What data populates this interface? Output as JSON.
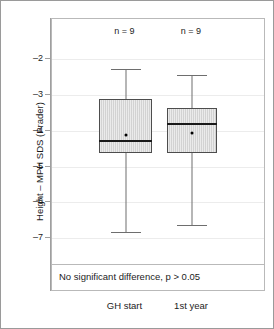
{
  "chart_data": {
    "type": "box",
    "title": "",
    "xlabel": "",
    "ylabel": "Height – MPH SDS (Prader)",
    "ylim": [
      -7.55,
      -1.55
    ],
    "yticks": [
      -2,
      -3,
      -4,
      -5,
      -6,
      -7
    ],
    "ytick_labels": [
      "–2",
      "–3",
      "–4",
      "–5",
      "–6",
      "–7"
    ],
    "grid": true,
    "legend": "none",
    "categories": [
      "GH start",
      "1st year"
    ],
    "series": [
      {
        "name": "GH start",
        "n_label": "n = 9",
        "n": 9,
        "whisker_low": -6.82,
        "q1": -4.62,
        "median": -4.28,
        "mean": -4.12,
        "q3": -3.1,
        "whisker_high": -2.28
      },
      {
        "name": "1st year",
        "n_label": "n = 9",
        "n": 9,
        "whisker_low": -6.63,
        "q1": -4.62,
        "median": -3.82,
        "mean": -4.05,
        "q3": -3.36,
        "whisker_high": -2.45
      }
    ],
    "annotation": "No significant difference, p > 0.05",
    "colors": {
      "box_fill": "#d2d2d2",
      "box_edge": "#4d4d4d",
      "median": "#1a1a1a",
      "whisker": "#6e6e6e",
      "grid": "#ececec",
      "frame": "#b9b9b9",
      "text": "#1c1c1c"
    }
  }
}
